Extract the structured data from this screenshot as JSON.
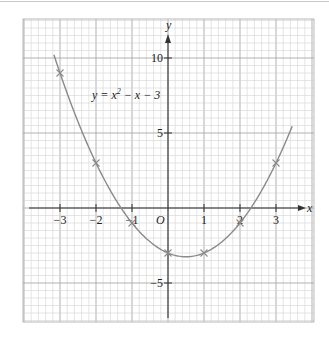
{
  "chart_data": {
    "type": "line",
    "title": "",
    "annotation": "y = x² − x − 3",
    "annotation_parts": {
      "lhs": "y = x",
      "exp": "2",
      "rhs": " − x − 3"
    },
    "xlabel": "x",
    "ylabel": "y",
    "origin_label": "O",
    "xlim": [
      -3.8,
      4.0
    ],
    "ylim": [
      -7.6,
      12.6
    ],
    "grid": true,
    "x_ticks": [
      -3,
      -2,
      -1,
      1,
      2,
      3
    ],
    "x_tick_labels": [
      "−3",
      "−2",
      "−1",
      "1",
      "2",
      "3"
    ],
    "y_ticks": [
      10,
      5,
      -5
    ],
    "y_tick_labels": [
      "10",
      "5",
      "−5"
    ],
    "series": [
      {
        "name": "y = x^2 - x - 3",
        "function": "x^2 - x - 3",
        "x_range": [
          -3.17,
          3.45
        ],
        "marked_points": {
          "x": [
            -3,
            -2,
            -1,
            0,
            1,
            2,
            3
          ],
          "y": [
            9,
            3,
            -1,
            -3,
            -3,
            -1,
            3
          ]
        }
      }
    ]
  },
  "colors": {
    "curve": "#8a8a8a",
    "grid_minor": "#d4d4d4",
    "grid_major": "#a8a8a8",
    "axis": "#333333"
  }
}
